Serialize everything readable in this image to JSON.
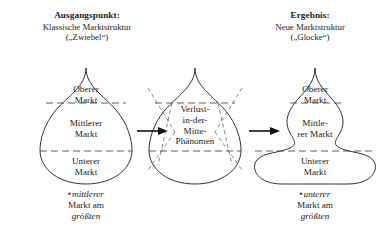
{
  "figure": {
    "left_heading": {
      "title": "Ausgangspunkt:",
      "subtitle": "Klassische Marktstruktur",
      "subtitle2": "(„Zwiebel“)"
    },
    "right_heading": {
      "title": "Ergebnis:",
      "subtitle": "Neue Marktstruktur",
      "subtitle2": "(„Glocke“)"
    },
    "onion": {
      "upper_line1": "Oberer",
      "upper_line2": "Markt",
      "middle_line1": "Mittlerer",
      "middle_line2": "Markt",
      "lower_line1": "Unterer",
      "lower_line2": "Markt"
    },
    "center": {
      "line1": "Verlust-",
      "line2": "in-der-",
      "line3": "Mitte-",
      "line4": "Phänomen"
    },
    "bell": {
      "upper_line1": "Oberer",
      "upper_line2": "Markt",
      "middle_line1": "Mittle-",
      "middle_line2": "rer Markt",
      "lower_line1": "Unterer",
      "lower_line2": "Markt"
    },
    "left_caption": {
      "mark": "▪",
      "emphasis": "mittlerer",
      "line2": "Markt am",
      "line3": "größten"
    },
    "right_caption": {
      "mark": "▪",
      "emphasis": "unterer",
      "line2": "Markt am",
      "line3": "größten"
    },
    "colors": {
      "outline": "#1a1a1a",
      "divider": "#4a4a4a",
      "squeeze": "#6a6a6a",
      "arrow": "#111111",
      "background": "#ffffff"
    }
  }
}
